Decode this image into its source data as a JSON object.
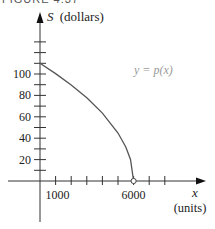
{
  "caption": "FIGURE 4.37",
  "chart_data": {
    "type": "line",
    "title": "",
    "xlabel": "x",
    "xlabel_units": "(units)",
    "ylabel": "S",
    "ylabel_units": "(dollars)",
    "x_tick_labels": [
      "1000",
      "6000"
    ],
    "x_tick_values": [
      1000,
      2000,
      3000,
      4000,
      5000,
      6000,
      7000,
      8000
    ],
    "y_tick_labels": [
      "20",
      "40",
      "60",
      "80",
      "100"
    ],
    "y_tick_values": [
      10,
      20,
      30,
      40,
      50,
      60,
      70,
      80,
      90,
      100,
      110,
      120,
      130
    ],
    "xlim": [
      -1000,
      8600
    ],
    "ylim": [
      -30,
      160
    ],
    "grid": false,
    "series": [
      {
        "name": "y = p(x)",
        "label": "y = p(x)",
        "description": "Demand curve, concave down, from (0,110) to (6000,0)",
        "x": [
          0,
          1000,
          2000,
          3000,
          4000,
          5000,
          5500,
          5800,
          6000
        ],
        "y": [
          110,
          100.4,
          89.8,
          77.8,
          63.5,
          44.9,
          31.8,
          20.1,
          0
        ]
      }
    ],
    "annotations": [
      {
        "text": "y = p(x)",
        "x": 4200,
        "y": 75
      },
      {
        "type": "open-circle",
        "x": 6000,
        "y": 0
      }
    ]
  }
}
